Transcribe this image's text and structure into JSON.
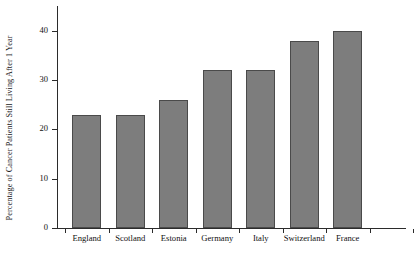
{
  "chart_data": {
    "type": "bar",
    "title": "",
    "subtitle": "",
    "xlabel": "",
    "ylabel": "Percentage of Cancer Patients Still Living After 1 Year",
    "categories": [
      "England",
      "Scotland",
      "Estonia",
      "Germany",
      "Italy",
      "Switzerland",
      "France"
    ],
    "values": [
      23,
      23,
      26,
      32,
      32,
      38,
      40
    ],
    "ylim": [
      0,
      45
    ],
    "ytick_labels": [
      "0",
      "10",
      "20",
      "30",
      "40"
    ],
    "ytick_values": [
      0,
      10,
      20,
      30,
      40
    ],
    "grid": false,
    "legend": null,
    "series": [
      {
        "name": "Percentage of Cancer Patients Still Living After 1 Year",
        "values": [
          23,
          23,
          26,
          32,
          32,
          38,
          40
        ]
      }
    ],
    "annotations": [],
    "colors": {
      "bar_fill": "#7d7d7d",
      "bar_edge": "#4a4a4a",
      "axis": "#2b2b2b",
      "text": "#111111",
      "background": "#ffffff"
    }
  }
}
